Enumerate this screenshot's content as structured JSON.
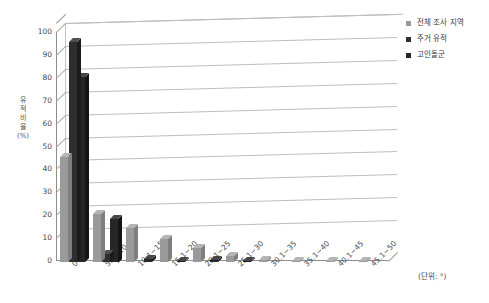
{
  "chart_data": {
    "type": "bar",
    "title": "",
    "subtitle": "",
    "xlabel": "",
    "ylabel": "유적 비율 (%)",
    "ylabel_chars": [
      "유",
      "적",
      "비",
      "율",
      "(%)"
    ],
    "unit_note": "(단위: °)",
    "grid": true,
    "legend_position": "top-right",
    "ylim": [
      0,
      100
    ],
    "ytick_values": [
      100,
      90,
      80,
      70,
      60,
      50,
      40,
      30,
      20,
      10,
      0
    ],
    "categories": [
      "0~5",
      "5.1~10",
      "10.1~15",
      "15.1~20",
      "20.1~25",
      "25.1~30",
      "30.1~35",
      "35.1~40",
      "40.1~45",
      "45.1~50"
    ],
    "series": [
      {
        "name": "전체 조사 지역",
        "color": "#9a9a9a",
        "top_color": "#b5b5b5",
        "side_color": "#7f7f7f",
        "values": [
          46,
          21,
          15,
          10,
          6,
          2.5,
          1,
          0.5,
          0.3,
          0.2
        ]
      },
      {
        "name": "주거 유적",
        "color": "#2e2e2e",
        "top_color": "#4f4f4f",
        "side_color": "#1b1b1b",
        "values": [
          96,
          3.5,
          0,
          0,
          0,
          0,
          0,
          0,
          0,
          0
        ]
      },
      {
        "name": "고인돌군",
        "color": "#262626",
        "top_color": "#464646",
        "side_color": "#141414",
        "values": [
          81,
          19,
          1.5,
          0.5,
          1,
          0.5,
          0,
          0,
          0,
          0
        ]
      }
    ]
  },
  "colors": {
    "axis": "#8d8d8d",
    "grid": "#bdbdbd",
    "text": "#3a3a3a",
    "background": "#ffffff"
  }
}
